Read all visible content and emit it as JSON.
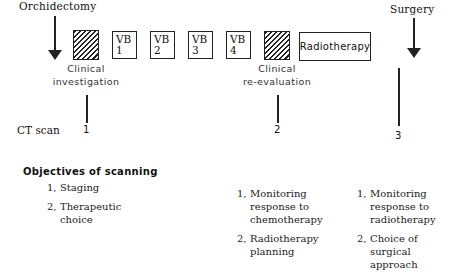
{
  "events": {
    "start": "Orchidectomy",
    "end": "Surgery"
  },
  "timeline_boxes": [
    {
      "type": "hatched",
      "label": ""
    },
    {
      "type": "vb",
      "line1": "VB",
      "line2": "1"
    },
    {
      "type": "vb",
      "line1": "VB",
      "line2": "2"
    },
    {
      "type": "vb",
      "line1": "VB",
      "line2": "3"
    },
    {
      "type": "vb",
      "line1": "VB",
      "line2": "4"
    },
    {
      "type": "hatched",
      "label": ""
    },
    {
      "type": "text",
      "label": "Radiotherapy"
    }
  ],
  "phases": {
    "first": {
      "line1": "Clinical",
      "line2": "investigation"
    },
    "second": {
      "line1": "Clinical",
      "line2": "re-evaluation"
    }
  },
  "ct_scan": {
    "label": "CT scan",
    "points": [
      "1",
      "2",
      "3"
    ]
  },
  "objectives": {
    "heading": "Objectives of scanning",
    "columns": [
      {
        "items": [
          {
            "num": "1,",
            "lines": [
              "Staging"
            ]
          },
          {
            "num": "2,",
            "lines": [
              "Therapeutic",
              "choice"
            ]
          }
        ]
      },
      {
        "items": [
          {
            "num": "1,",
            "lines": [
              "Monitoring",
              "response to",
              "chemotherapy"
            ]
          },
          {
            "num": "2,",
            "lines": [
              "Radiotherapy",
              "planning"
            ]
          }
        ]
      },
      {
        "items": [
          {
            "num": "1,",
            "lines": [
              "Monitoring",
              "response to",
              "radiotherapy"
            ]
          },
          {
            "num": "2,",
            "lines": [
              "Choice of",
              "surgical",
              "approach"
            ]
          }
        ]
      }
    ]
  }
}
